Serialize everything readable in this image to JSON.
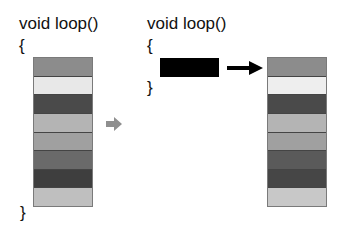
{
  "left": {
    "header": "void loop()",
    "open_brace": "{",
    "close_brace": "}",
    "stripes": [
      "#8c8c8c",
      "#e8e8e8",
      "#4a4a4a",
      "#b4b4b4",
      "#a0a0a0",
      "#6a6a6a",
      "#3e3e3e",
      "#bfbfbf"
    ]
  },
  "middle_arrow": {
    "color": "#8f8f8f",
    "icon": "right-arrow-icon"
  },
  "right": {
    "header": "void loop()",
    "open_brace": "{",
    "close_brace": "}",
    "block_color": "#000000",
    "arrow_color": "#000000",
    "stripes": [
      "#8c8c8c",
      "#eeeeee",
      "#4a4a4a",
      "#b4b4b4",
      "#a0a0a0",
      "#5a5a5a",
      "#464646",
      "#c8c8c8"
    ]
  }
}
